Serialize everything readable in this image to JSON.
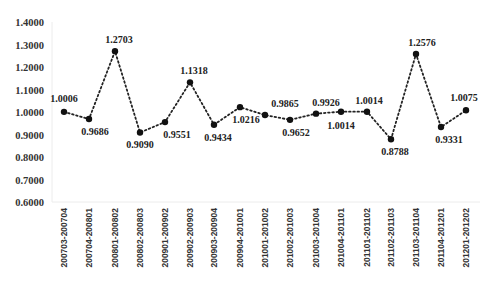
{
  "chart_data": {
    "type": "line",
    "title": "",
    "xlabel": "",
    "ylabel": "",
    "ylim": [
      0.6,
      1.4
    ],
    "yticks": [
      "0.6000",
      "0.7000",
      "0.8000",
      "0.9000",
      "1.0000",
      "1.1000",
      "1.2000",
      "1.3000",
      "1.4000"
    ],
    "grid": false,
    "legend": null,
    "line_style": "dotted",
    "marker": "circle",
    "categories": [
      "200703-200704",
      "200704-200801",
      "200801-200802",
      "200802-200803",
      "200901-200902",
      "200902-200903",
      "200903-200904",
      "200904-201001",
      "201001-201002",
      "201002-201003",
      "201003-201004",
      "201004-201101",
      "201101-201102",
      "201102-201103",
      "201103-201104",
      "201104-201201",
      "201201-201202"
    ],
    "values": [
      1.0006,
      0.9686,
      1.2703,
      0.909,
      0.9551,
      1.1318,
      0.9434,
      1.0216,
      0.9865,
      0.9652,
      0.9926,
      1.0014,
      1.0014,
      0.8788,
      1.2576,
      0.9331,
      1.0075
    ],
    "data_labels": [
      "1.0006",
      "0.9686",
      "1.2703",
      "0.9090",
      "0.9551",
      "1.1318",
      "0.9434",
      "1.0216",
      "0.9865",
      "0.9652",
      "0.9926",
      "1.0014",
      "1.0014",
      "0.8788",
      "1.2576",
      "0.9331",
      "1.0075"
    ],
    "label_positions": [
      "above",
      "below",
      "above",
      "below",
      "below",
      "above",
      "below",
      "below",
      "above",
      "below",
      "above",
      "below",
      "above",
      "below",
      "above",
      "below",
      "above"
    ],
    "x_positions": [
      64,
      89,
      115,
      140,
      165,
      190,
      214,
      240,
      265,
      290,
      316,
      341,
      367,
      391,
      416,
      441,
      466
    ],
    "colors": {
      "line": "#222222",
      "marker": "#111111",
      "axis": "#e6e6e6",
      "text": "#333333"
    }
  }
}
